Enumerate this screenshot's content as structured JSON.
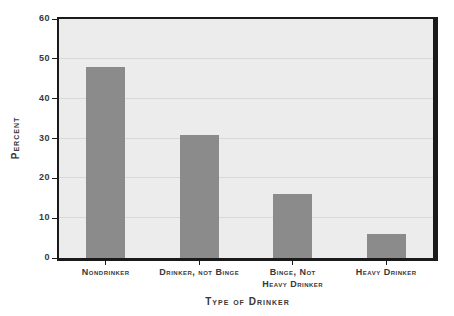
{
  "chart_data": {
    "type": "bar",
    "title": "",
    "xlabel": "Type of Drinker",
    "ylabel": "Percent",
    "categories": [
      "Nondrinker",
      "Drinker, not Binge",
      "Binge, Not Heavy Drinker",
      "Heavy Drinker"
    ],
    "category_label_lines": [
      [
        "Nondrinker"
      ],
      [
        "Drinker, not Binge"
      ],
      [
        "Binge, Not",
        "Heavy Drinker"
      ],
      [
        "Heavy Drinker"
      ]
    ],
    "values": [
      48,
      31,
      16,
      6
    ],
    "ylim": [
      0,
      60
    ],
    "yticks": [
      0,
      10,
      20,
      30,
      40,
      50,
      60
    ],
    "grid": "horizontal",
    "legend": "none",
    "colors": {
      "bar": "#8b8b8b",
      "plot_background": "#ececec",
      "gridline": "#d8d8d8",
      "frame": "#1a1a1a",
      "text": "#383838",
      "page_background": "#ffffff"
    }
  }
}
